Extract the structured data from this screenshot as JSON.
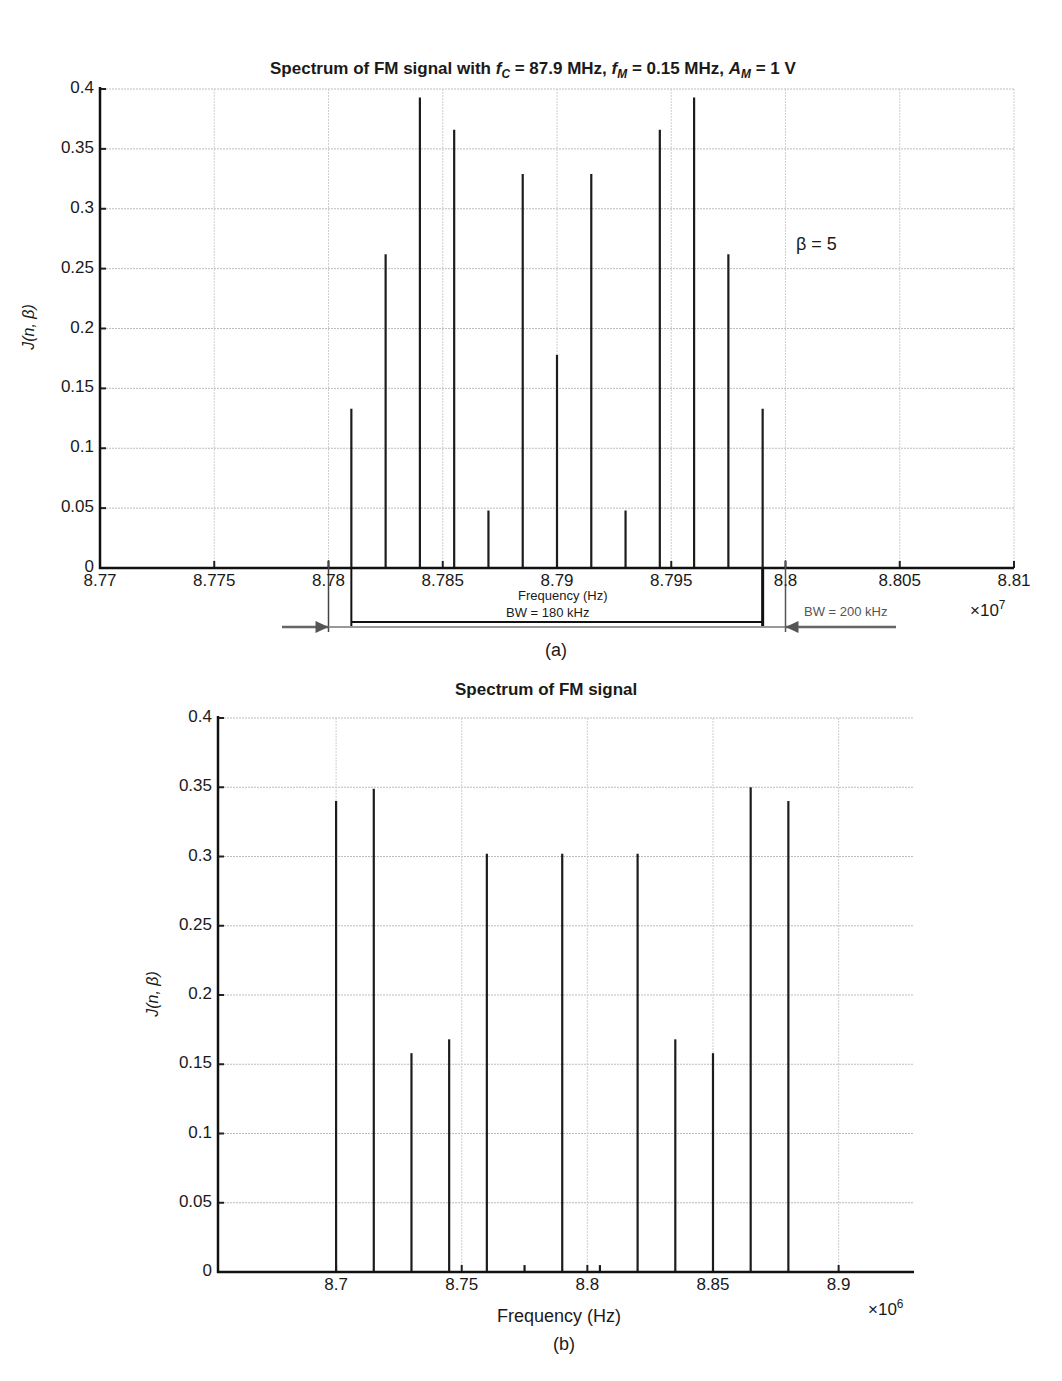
{
  "figure_a": {
    "title_prefix": "Spectrum of FM signal with ",
    "title_fc_sym": "f",
    "title_fc_sub": "C",
    "title_fc_val": " = 87.9 MHz, ",
    "title_fm_sym": "f",
    "title_fm_sub": "M",
    "title_fm_val": " = 0.15 MHz, ",
    "title_am_sym": "A",
    "title_am_sub": "M",
    "title_am_val": " = 1 V",
    "ylabel": "J(n, β)",
    "xlabel": "Frequency (Hz)",
    "x_multiplier_base": "×10",
    "x_multiplier_exp": "7",
    "annotation_beta": "β = 5",
    "bw_inner_label": "BW = 180 kHz",
    "bw_outer_label": "BW = 200 kHz",
    "caption": "(a)",
    "yticks": [
      "0",
      "0.05",
      "0.1",
      "0.15",
      "0.2",
      "0.25",
      "0.3",
      "0.35",
      "0.4"
    ],
    "xticks": [
      "8.77",
      "8.775",
      "8.78",
      "8.785",
      "8.79",
      "8.795",
      "8.8",
      "8.805",
      "8.81"
    ]
  },
  "figure_b": {
    "title": "Spectrum of FM signal",
    "ylabel": "J(n, β)",
    "xlabel": "Frequency (Hz)",
    "x_multiplier_base": "×10",
    "x_multiplier_exp": "6",
    "caption": "(b)",
    "yticks": [
      "0",
      "0.05",
      "0.1",
      "0.15",
      "0.2",
      "0.25",
      "0.3",
      "0.35",
      "0.4"
    ],
    "xticks": [
      "8.7",
      "8.75",
      "8.8",
      "8.85",
      "8.9"
    ]
  },
  "chart_data": [
    {
      "type": "bar",
      "subtype": "stem",
      "title": "Spectrum of FM signal with fC = 87.9 MHz, fM = 0.15 MHz, AM = 1 V",
      "xlabel": "Frequency (Hz)",
      "ylabel": "J(n, β)",
      "x_scale": "×10^7",
      "xlim": [
        8.77,
        8.81
      ],
      "ylim": [
        0,
        0.4
      ],
      "grid": true,
      "annotations": [
        "β = 5",
        "BW = 180 kHz",
        "BW = 200 kHz"
      ],
      "x": [
        8.781,
        8.7825,
        8.784,
        8.7855,
        8.787,
        8.7885,
        8.79,
        8.7915,
        8.793,
        8.7945,
        8.796,
        8.7975,
        8.799
      ],
      "values": [
        0.133,
        0.262,
        0.393,
        0.366,
        0.048,
        0.329,
        0.178,
        0.329,
        0.048,
        0.366,
        0.393,
        0.262,
        0.133
      ],
      "caption": "(a)"
    },
    {
      "type": "bar",
      "subtype": "stem",
      "title": "Spectrum of FM signal",
      "xlabel": "Frequency (Hz)",
      "ylabel": "J(n, β)",
      "x_scale": "×10^6",
      "xlim": [
        8.653,
        8.93
      ],
      "ylim": [
        0,
        0.4
      ],
      "grid": true,
      "x": [
        8.7,
        8.715,
        8.73,
        8.745,
        8.76,
        8.775,
        8.79,
        8.805,
        8.82,
        8.835,
        8.85,
        8.865,
        8.88
      ],
      "values": [
        0.34,
        0.349,
        0.158,
        0.168,
        0.302,
        0.005,
        0.302,
        0.005,
        0.302,
        0.168,
        0.158,
        0.35,
        0.34
      ],
      "caption": "(b)"
    }
  ]
}
